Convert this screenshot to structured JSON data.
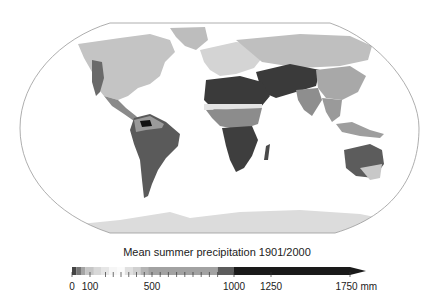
{
  "map": {
    "projection": "robinson-like world",
    "ocean_color": "#ffffff",
    "outline_color": "#999999",
    "regions": [
      {
        "name": "north-america",
        "shade": "#c4c4c4"
      },
      {
        "name": "north-america-west",
        "shade": "#6a6a6a"
      },
      {
        "name": "central-america",
        "shade": "#8a8a8a"
      },
      {
        "name": "greenland",
        "shade": "#bdbdbd"
      },
      {
        "name": "south-america",
        "shade": "#5a5a5a"
      },
      {
        "name": "amazon-core",
        "shade": "#111111"
      },
      {
        "name": "south-america-north",
        "shade": "#9a9a9a"
      },
      {
        "name": "europe",
        "shade": "#d4d4d4"
      },
      {
        "name": "russia-north",
        "shade": "#bfbfbf"
      },
      {
        "name": "africa-north",
        "shade": "#3a3a3a"
      },
      {
        "name": "sahel-band",
        "shade": "#e4e4e4"
      },
      {
        "name": "africa-central",
        "shade": "#8c8c8c"
      },
      {
        "name": "africa-south",
        "shade": "#3e3e3e"
      },
      {
        "name": "madagascar",
        "shade": "#4a4a4a"
      },
      {
        "name": "middle-east-central-asia",
        "shade": "#3a3a3a"
      },
      {
        "name": "india",
        "shade": "#8e8e8e"
      },
      {
        "name": "east-asia",
        "shade": "#a8a8a8"
      },
      {
        "name": "south-east-asia",
        "shade": "#9a9a9a"
      },
      {
        "name": "indonesia",
        "shade": "#9e9e9e"
      },
      {
        "name": "australia",
        "shade": "#5c5c5c"
      },
      {
        "name": "australia-south",
        "shade": "#c8c8c8"
      },
      {
        "name": "antarctica",
        "shade": "#dcdcdc"
      }
    ]
  },
  "legend": {
    "title": "Mean summer precipitation 1901/2000",
    "unit": "mm",
    "min": 0,
    "max": 1750,
    "ticks": [
      {
        "value": 0,
        "label": "0"
      },
      {
        "value": 100,
        "label": "100"
      },
      {
        "value": 500,
        "label": "500"
      },
      {
        "value": 1000,
        "label": "1000"
      },
      {
        "value": 1250,
        "label": "1250"
      },
      {
        "value": 1750,
        "label": "1750"
      }
    ],
    "bins": [
      {
        "from": 0,
        "to": 25,
        "color": "#444444"
      },
      {
        "from": 25,
        "to": 50,
        "color": "#777777"
      },
      {
        "from": 50,
        "to": 75,
        "color": "#a4a4a4"
      },
      {
        "from": 75,
        "to": 125,
        "color": "#c6c6c6"
      },
      {
        "from": 125,
        "to": 175,
        "color": "#d8d8d8"
      },
      {
        "from": 175,
        "to": 225,
        "color": "#e6e6e6"
      },
      {
        "from": 225,
        "to": 275,
        "color": "#f6f6f6"
      },
      {
        "from": 275,
        "to": 325,
        "color": "#fbfbfb"
      },
      {
        "from": 325,
        "to": 375,
        "color": "#e0e0e0"
      },
      {
        "from": 375,
        "to": 425,
        "color": "#d0d0d0"
      },
      {
        "from": 425,
        "to": 475,
        "color": "#b4b4b4"
      },
      {
        "from": 475,
        "to": 900,
        "color": "#a2a2a2"
      },
      {
        "from": 900,
        "to": 1000,
        "color": "#5c5c5c"
      },
      {
        "from": 1000,
        "to": 1750,
        "color": "#1a1a1a"
      }
    ],
    "minor_ticks": [
      200,
      250,
      300,
      350,
      400,
      450,
      550,
      600,
      650,
      700,
      750,
      800,
      850,
      900
    ]
  }
}
